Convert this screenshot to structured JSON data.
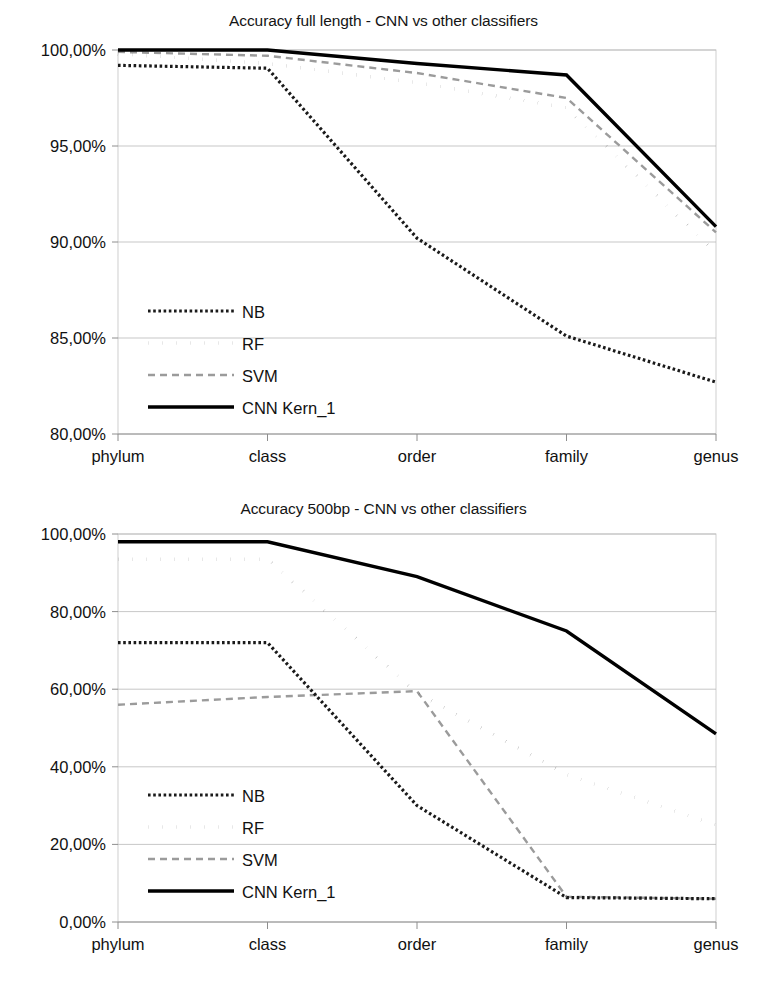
{
  "charts": [
    {
      "id": "accuracy-full-length",
      "title": "Accuracy full length - CNN vs other classifiers",
      "ylabels": [
        "100,00%",
        "95,00%",
        "90,00%",
        "85,00%",
        "80,00%"
      ],
      "xlabels": [
        "phylum",
        "class",
        "order",
        "family",
        "genus"
      ],
      "legend": [
        "NB",
        "RF",
        "SVM",
        "CNN Kern_1"
      ],
      "chart_data": {
        "type": "line",
        "title": "Accuracy full length - CNN vs other classifiers",
        "xlabel": "",
        "ylabel": "",
        "categories": [
          "phylum",
          "class",
          "order",
          "family",
          "genus"
        ],
        "ylim": [
          80,
          100
        ],
        "yticks": [
          80,
          85,
          90,
          95,
          100
        ],
        "ytick_labels": [
          "80,00%",
          "85,00%",
          "90,00%",
          "95,00%",
          "100,00%"
        ],
        "grid": true,
        "legend_position": "inside-lower-left",
        "series": [
          {
            "name": "NB",
            "style": "dotted",
            "color": "#1a1a1a",
            "values": [
              99.2,
              99.05,
              90.2,
              85.1,
              82.7
            ]
          },
          {
            "name": "RF",
            "style": "sparse-dots",
            "color": "#1a1a1a",
            "values": [
              99.8,
              99.3,
              98.3,
              97.0,
              89.4
            ]
          },
          {
            "name": "SVM",
            "style": "dashed",
            "color": "#9b9b9b",
            "values": [
              99.9,
              99.7,
              98.8,
              97.5,
              90.5
            ]
          },
          {
            "name": "CNN Kern_1",
            "style": "solid-thick",
            "color": "#000000",
            "values": [
              100.0,
              100.0,
              99.3,
              98.7,
              90.8
            ]
          }
        ]
      }
    },
    {
      "id": "accuracy-500bp",
      "title": "Accuracy 500bp - CNN vs other classifiers",
      "ylabels": [
        "100,00%",
        "80,00%",
        "60,00%",
        "40,00%",
        "20,00%",
        "0,00%"
      ],
      "xlabels": [
        "phylum",
        "class",
        "order",
        "family",
        "genus"
      ],
      "legend": [
        "NB",
        "RF",
        "SVM",
        "CNN Kern_1"
      ],
      "chart_data": {
        "type": "line",
        "title": "Accuracy 500bp - CNN vs other classifiers",
        "xlabel": "",
        "ylabel": "",
        "categories": [
          "phylum",
          "class",
          "order",
          "family",
          "genus"
        ],
        "ylim": [
          0,
          100
        ],
        "yticks": [
          0,
          20,
          40,
          60,
          80,
          100
        ],
        "ytick_labels": [
          "0,00%",
          "20,00%",
          "40,00%",
          "60,00%",
          "80,00%",
          "100,00%"
        ],
        "grid": true,
        "legend_position": "inside-lower-left",
        "series": [
          {
            "name": "NB",
            "style": "dotted",
            "color": "#1a1a1a",
            "values": [
              72.0,
              72.0,
              30.0,
              6.3,
              6.0
            ]
          },
          {
            "name": "RF",
            "style": "sparse-dots",
            "color": "#1a1a1a",
            "values": [
              93.5,
              93.5,
              59.0,
              38.0,
              25.0
            ]
          },
          {
            "name": "SVM",
            "style": "dashed",
            "color": "#9b9b9b",
            "values": [
              56.0,
              58.0,
              59.5,
              6.5,
              6.0
            ]
          },
          {
            "name": "CNN Kern_1",
            "style": "solid-thick",
            "color": "#000000",
            "values": [
              98.0,
              98.0,
              89.0,
              75.0,
              48.5
            ]
          }
        ]
      }
    }
  ]
}
